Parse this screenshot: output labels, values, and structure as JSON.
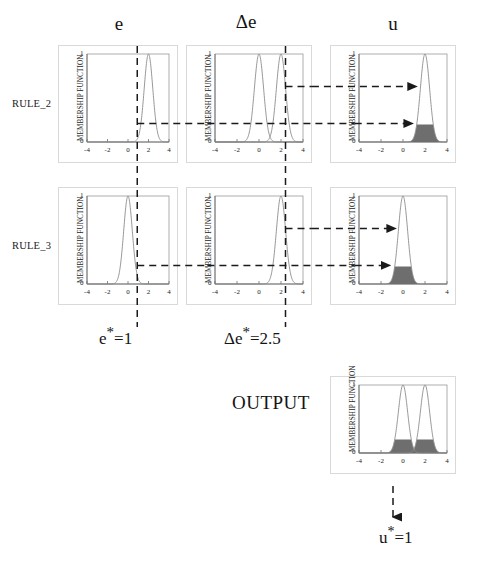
{
  "figure": {
    "type": "fuzzy-inference-diagram",
    "title_columns": [
      {
        "name": "e",
        "label": "e"
      },
      {
        "name": "delta-e",
        "label": "Δe"
      },
      {
        "name": "u",
        "label": "u"
      }
    ],
    "row_labels": [
      {
        "name": "rule-2",
        "label": "RULE_2"
      },
      {
        "name": "rule-3",
        "label": "RULE_3"
      }
    ],
    "output_label": "OUTPUT",
    "crisp_inputs": [
      {
        "name": "e-star",
        "symbol": "e",
        "sup": "*",
        "eq": "=1",
        "value": 1
      },
      {
        "name": "delta-e-star",
        "symbol": "Δe",
        "sup": "*",
        "eq": "=2.5",
        "value": 2.5
      }
    ],
    "crisp_output": {
      "symbol": "u",
      "sup": "*",
      "eq": "=1",
      "value": 1
    },
    "axis": {
      "ylabel": "MEMBERSHIP FUNCTION",
      "xticks": [
        "-4",
        "-2",
        "0",
        "2",
        "4"
      ],
      "yticks": [
        "0",
        "1"
      ],
      "xlim": [
        -4,
        4
      ],
      "ylim": [
        0,
        1
      ]
    },
    "colors": {
      "curve": "#8c8c8c",
      "fill": "#6e6e6e",
      "axis": "#8a8a8a",
      "frame": "#d9d9d9",
      "dash": "#1a1a1a",
      "text": "#141414"
    }
  },
  "chart_data": [
    {
      "name": "rule2-e",
      "type": "line",
      "title": "",
      "xlabel": "",
      "ylabel": "MEMBERSHIP FUNCTION",
      "xlim": [
        -4,
        4
      ],
      "ylim": [
        0,
        1
      ],
      "grid": false,
      "series": [
        {
          "name": "mf-positive",
          "kind": "gaussian",
          "center": 2,
          "sigma": 0.42,
          "peak": 1
        }
      ],
      "markers": {
        "vertical_input": 1,
        "horizontal_membership": 0.2
      }
    },
    {
      "name": "rule2-delta-e",
      "type": "line",
      "title": "",
      "xlabel": "",
      "ylabel": "MEMBERSHIP FUNCTION",
      "xlim": [
        -4,
        4
      ],
      "ylim": [
        0,
        1
      ],
      "grid": false,
      "series": [
        {
          "name": "mf-zero",
          "kind": "gaussian",
          "center": 0,
          "sigma": 0.42,
          "peak": 1
        },
        {
          "name": "mf-positive",
          "kind": "gaussian",
          "center": 2,
          "sigma": 0.42,
          "peak": 1
        }
      ],
      "markers": {
        "vertical_input": 2.5,
        "horizontal_membership": 0.62,
        "horizontal_membership_2": 0.2
      }
    },
    {
      "name": "rule2-u",
      "type": "area",
      "title": "",
      "xlabel": "",
      "ylabel": "MEMBERSHIP FUNCTION",
      "xlim": [
        -4,
        4
      ],
      "ylim": [
        0,
        1
      ],
      "grid": false,
      "series": [
        {
          "name": "mf-positive",
          "kind": "gaussian",
          "center": 2,
          "sigma": 0.42,
          "peak": 1
        }
      ],
      "clip_level": 0.2
    },
    {
      "name": "rule3-e",
      "type": "line",
      "title": "",
      "xlabel": "",
      "ylabel": "MEMBERSHIP FUNCTION",
      "xlim": [
        -4,
        4
      ],
      "ylim": [
        0,
        1
      ],
      "grid": false,
      "series": [
        {
          "name": "mf-zero",
          "kind": "gaussian",
          "center": 0,
          "sigma": 0.42,
          "peak": 1
        }
      ],
      "markers": {
        "vertical_input": 1,
        "horizontal_membership": 0.2
      }
    },
    {
      "name": "rule3-delta-e",
      "type": "line",
      "title": "",
      "xlabel": "",
      "ylabel": "MEMBERSHIP FUNCTION",
      "xlim": [
        -4,
        4
      ],
      "ylim": [
        0,
        1
      ],
      "grid": false,
      "series": [
        {
          "name": "mf-positive",
          "kind": "gaussian",
          "center": 2,
          "sigma": 0.42,
          "peak": 1
        }
      ],
      "markers": {
        "vertical_input": 2.5,
        "horizontal_membership": 0.62,
        "horizontal_membership_2": 0.2
      }
    },
    {
      "name": "rule3-u",
      "type": "area",
      "title": "",
      "xlabel": "",
      "ylabel": "MEMBERSHIP FUNCTION",
      "xlim": [
        -4,
        4
      ],
      "ylim": [
        0,
        1
      ],
      "grid": false,
      "series": [
        {
          "name": "mf-zero",
          "kind": "gaussian",
          "center": 0,
          "sigma": 0.42,
          "peak": 1
        }
      ],
      "clip_level": 0.2
    },
    {
      "name": "output-u",
      "type": "area",
      "title": "",
      "xlabel": "",
      "ylabel": "MEMBERSHIP FUNCTION",
      "xlim": [
        -4,
        4
      ],
      "ylim": [
        0,
        1
      ],
      "grid": false,
      "series": [
        {
          "name": "mf-zero",
          "kind": "gaussian",
          "center": 0,
          "sigma": 0.42,
          "peak": 1
        },
        {
          "name": "mf-positive",
          "kind": "gaussian",
          "center": 2,
          "sigma": 0.42,
          "peak": 1
        }
      ],
      "clip_level": 0.2,
      "aggregation": "max"
    }
  ]
}
